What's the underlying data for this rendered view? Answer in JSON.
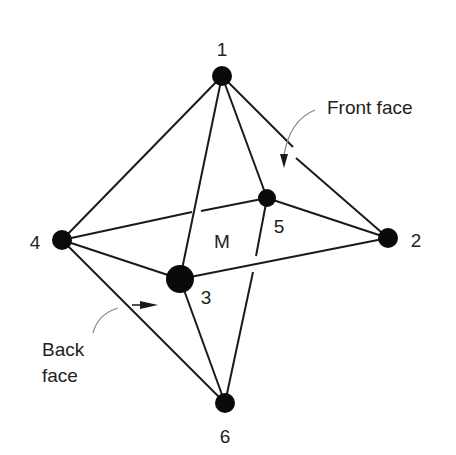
{
  "diagram": {
    "type": "octahedron",
    "vertices": [
      {
        "id": "1",
        "label": "1",
        "x": 222,
        "y": 76,
        "r": 10,
        "lx": 222,
        "ly": 56
      },
      {
        "id": "2",
        "label": "2",
        "x": 388,
        "y": 238,
        "r": 10,
        "lx": 416,
        "ly": 247
      },
      {
        "id": "3",
        "label": "3",
        "x": 180,
        "y": 279,
        "r": 14,
        "lx": 206,
        "ly": 304
      },
      {
        "id": "4",
        "label": "4",
        "x": 62,
        "y": 240,
        "r": 10,
        "lx": 35,
        "ly": 249
      },
      {
        "id": "5",
        "label": "5",
        "x": 267,
        "y": 198,
        "r": 9,
        "lx": 279,
        "ly": 233
      },
      {
        "id": "6",
        "label": "6",
        "x": 225,
        "y": 403,
        "r": 10,
        "lx": 225,
        "ly": 443
      }
    ],
    "edges": [
      {
        "from": "1",
        "to": "4"
      },
      {
        "from": "1",
        "to": "3"
      },
      {
        "from": "1",
        "to": "5"
      },
      {
        "from": "1",
        "to": "2",
        "broken": true
      },
      {
        "from": "4",
        "to": "3"
      },
      {
        "from": "4",
        "to": "5",
        "broken": true
      },
      {
        "from": "4",
        "to": "6"
      },
      {
        "from": "3",
        "to": "2"
      },
      {
        "from": "5",
        "to": "2"
      },
      {
        "from": "3",
        "to": "6"
      },
      {
        "from": "5",
        "to": "6",
        "broken": true
      },
      {
        "from": "2",
        "to": "6"
      }
    ],
    "center_label": "M",
    "annotations": {
      "front_face": "Front face",
      "back_face_line1": "Back",
      "back_face_line2": "face"
    }
  }
}
